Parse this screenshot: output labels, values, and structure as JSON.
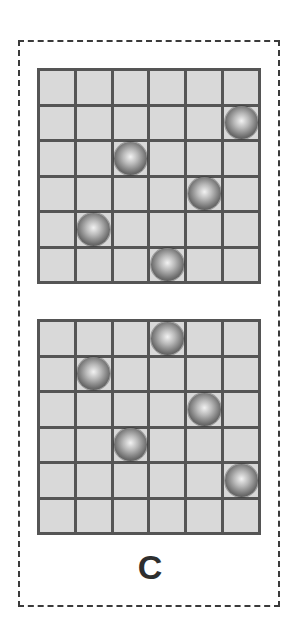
{
  "figure": {
    "label": "C",
    "grid_size": 6,
    "grids": [
      {
        "id": "top",
        "balls": [
          [
            1,
            5
          ],
          [
            2,
            2
          ],
          [
            3,
            4
          ],
          [
            4,
            1
          ],
          [
            5,
            3
          ]
        ]
      },
      {
        "id": "bottom",
        "balls": [
          [
            0,
            3
          ],
          [
            1,
            1
          ],
          [
            2,
            4
          ],
          [
            3,
            2
          ],
          [
            4,
            5
          ]
        ]
      }
    ],
    "colors": {
      "cell": "#d9d9d9",
      "grid_line": "#555555",
      "frame": "#3a3a3a",
      "label": "#2e2e2e"
    }
  }
}
